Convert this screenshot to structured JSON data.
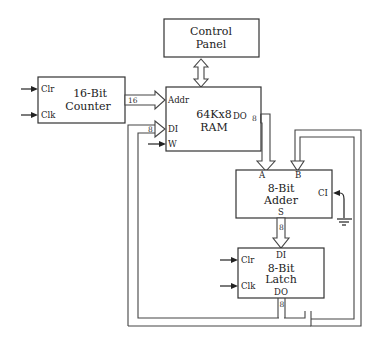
{
  "diagram": {
    "blocks": {
      "control_panel": {
        "line1": "Control",
        "line2": "Panel"
      },
      "counter": {
        "line1": "16-Bit",
        "line2": "Counter",
        "pins": {
          "clr": "Clr",
          "clk": "Clk"
        }
      },
      "ram": {
        "line1": "64Kx8",
        "line2": "RAM",
        "pins": {
          "addr": "Addr",
          "di": "DI",
          "w": "W",
          "do": "DO"
        }
      },
      "adder": {
        "line1": "8-Bit",
        "line2": "Adder",
        "pins": {
          "a": "A",
          "b": "B",
          "ci": "CI",
          "s": "S"
        }
      },
      "latch": {
        "line1": "8-Bit",
        "line2": "Latch",
        "pins": {
          "di": "DI",
          "clr": "Clr",
          "clk": "Clk",
          "do": "DO"
        }
      }
    },
    "bus_widths": {
      "counter_to_addr": "16",
      "latch_to_ram_di": "8",
      "ram_do": "8",
      "adder_s": "8",
      "latch_do": "8"
    },
    "connections": [
      "Control Panel <-> RAM (bidirectional)",
      "Counter -> RAM Addr (16)",
      "RAM DO -> Adder A (8)",
      "Latch DO -> Adder B (feedback)",
      "Latch DO -> RAM DI (8)",
      "Adder S -> Latch DI (8)",
      "Ground -> Adder CI"
    ]
  }
}
